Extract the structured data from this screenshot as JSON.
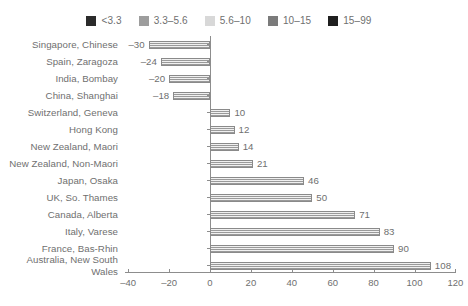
{
  "legend": {
    "position": "top-center",
    "items": [
      {
        "label": "<3.3",
        "color": "#2b2b2b",
        "swatch_name": "legend-swatch-lt33"
      },
      {
        "label": "3.3–5.6",
        "color": "#9d9d9d",
        "swatch_name": "legend-swatch-33-56"
      },
      {
        "label": "5.6–10",
        "color": "#d8d8d8",
        "swatch_name": "legend-swatch-56-10"
      },
      {
        "label": "10–15",
        "color": "#7b7b7b",
        "swatch_name": "legend-swatch-10-15"
      },
      {
        "label": "15–99",
        "color": "#1f1f1f",
        "swatch_name": "legend-swatch-15-99"
      }
    ]
  },
  "chart_data": {
    "type": "bar",
    "orientation": "horizontal",
    "title": "",
    "subtitle": "",
    "xlabel": "",
    "ylabel": "",
    "xlim": [
      -40,
      120
    ],
    "xticks": [
      -40,
      -20,
      0,
      20,
      40,
      60,
      80,
      100,
      120
    ],
    "xtick_labels": [
      "–40",
      "–20",
      "0",
      "20",
      "40",
      "60",
      "80",
      "100",
      "120"
    ],
    "grid": false,
    "legend_position": "top-center",
    "categories": [
      "Singapore, Chinese",
      "Spain, Zaragoza",
      "India, Bombay",
      "China, Shanghai",
      "Switzerland, Geneva",
      "Hong Kong",
      "New Zealand, Maori",
      "New Zealand, Non-Maori",
      "Japan, Osaka",
      "UK, So. Thames",
      "Canada, Alberta",
      "Italy, Varese",
      "France, Bas-Rhin",
      "Australia, New South Wales"
    ],
    "values": [
      -30,
      -24,
      -20,
      -18,
      10,
      12,
      14,
      21,
      46,
      50,
      71,
      83,
      90,
      108
    ],
    "data_labels": [
      "–30",
      "–24",
      "–20",
      "–18",
      "10",
      "12",
      "14",
      "21",
      "46",
      "50",
      "71",
      "83",
      "90",
      "108"
    ],
    "bar_color": "#9a9a9a",
    "bar_pattern": "horizontal-hatch",
    "axis_color": "#8d8d8d",
    "text_color": "#6f6f6f"
  }
}
